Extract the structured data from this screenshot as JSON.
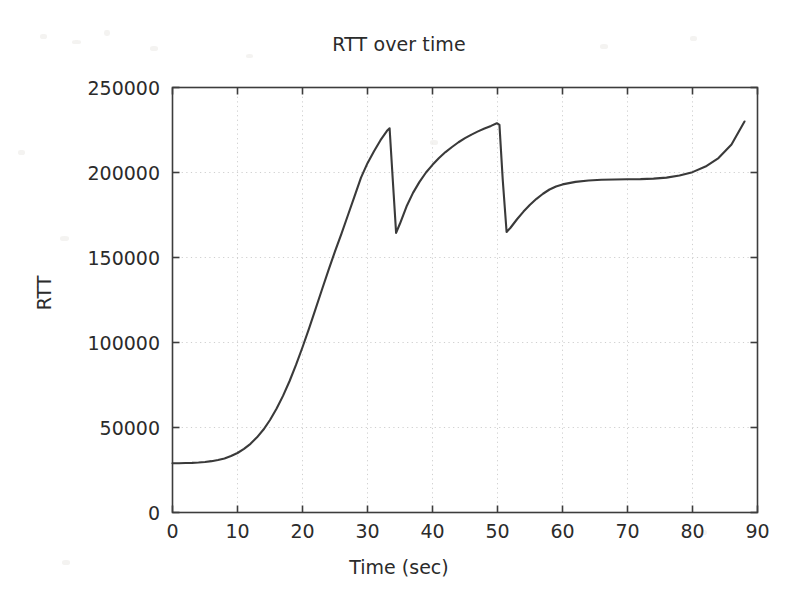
{
  "chart_data": {
    "type": "line",
    "title": "RTT over time",
    "xlabel": "Time (sec)",
    "ylabel": "RTT",
    "xlim": [
      0,
      90
    ],
    "ylim": [
      0,
      250000
    ],
    "xticks": [
      0,
      10,
      20,
      30,
      40,
      50,
      60,
      70,
      80,
      90
    ],
    "yticks": [
      0,
      50000,
      100000,
      150000,
      200000,
      250000
    ],
    "xtick_labels": [
      "0",
      "10",
      "20",
      "30",
      "40",
      "50",
      "60",
      "70",
      "80",
      "90"
    ],
    "ytick_labels": [
      "0",
      "50000",
      "100000",
      "150000",
      "200000",
      "250000"
    ],
    "grid": true,
    "grid_style": "dotted",
    "legend": null,
    "line_color": "#3a3a3a",
    "series": [
      {
        "name": "RTT",
        "x": [
          0,
          1,
          2,
          3,
          4,
          5,
          6,
          7,
          8,
          9,
          10,
          11,
          12,
          13,
          14,
          15,
          16,
          17,
          18,
          19,
          20,
          21,
          22,
          23,
          24,
          25,
          26,
          27,
          28,
          29,
          30,
          31,
          32,
          33,
          33.4,
          33.9,
          34.4,
          35,
          36,
          37,
          38,
          39,
          40,
          41,
          42,
          43,
          44,
          45,
          46,
          47,
          48,
          49,
          49.9,
          50.3,
          50.8,
          51.4,
          52,
          53,
          54,
          55,
          56,
          57,
          58,
          59,
          60,
          62,
          64,
          66,
          68,
          70,
          72,
          74,
          76,
          78,
          80,
          82,
          84,
          86,
          88
        ],
        "y": [
          29000,
          29000,
          29100,
          29200,
          29400,
          29700,
          30200,
          30900,
          31800,
          33200,
          35000,
          37400,
          40400,
          44200,
          48800,
          54400,
          61000,
          68600,
          77200,
          86800,
          97200,
          108200,
          119600,
          131200,
          142600,
          153600,
          164000,
          175000,
          186000,
          197000,
          205500,
          212500,
          219000,
          224500,
          226000,
          195000,
          164500,
          170000,
          180000,
          188000,
          194500,
          200000,
          204500,
          208500,
          212000,
          215000,
          217800,
          220200,
          222300,
          224200,
          225900,
          227400,
          229000,
          228000,
          196000,
          165000,
          167500,
          172500,
          177000,
          181000,
          184500,
          187500,
          190000,
          191800,
          193000,
          194500,
          195300,
          195700,
          195900,
          196000,
          196100,
          196400,
          197000,
          198200,
          200200,
          203500,
          208500,
          216500,
          230000
        ]
      }
    ]
  }
}
